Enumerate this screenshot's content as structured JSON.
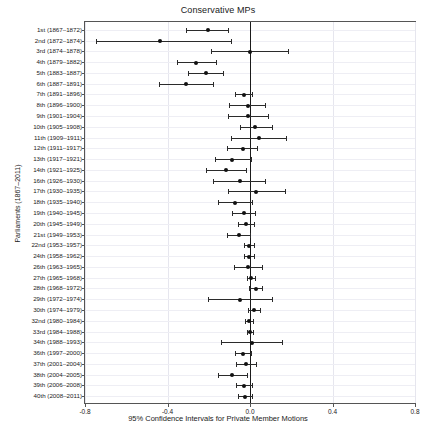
{
  "chart_data": {
    "type": "scatter",
    "subtype": "forest-plot",
    "title": "Conservative MPs",
    "xlabel": "95% Confidence Intervals for Private Member Motions",
    "ylabel": "Parliaments (1867–2011)",
    "xlim": [
      -0.8,
      0.8
    ],
    "xticks": [
      -0.8,
      -0.4,
      0.0,
      0.4,
      0.8
    ],
    "xticklabels": [
      "-0.8",
      "-0.4",
      "0.0",
      "0.4",
      "0.8"
    ],
    "grid": true,
    "legend": null,
    "reference_line": 0.0,
    "categories": [
      "1st (1867–1872)",
      "2nd (1872–1874)",
      "3rd (1874–1878)",
      "4th (1879–1882)",
      "5th (1883–1887)",
      "6th (1887–1891)",
      "7th (1891–1896)",
      "8th (1896–1900)",
      "9th (1901–1904)",
      "10th (1905–1908)",
      "11th (1909–1911)",
      "12th (1911–1917)",
      "13th (1917–1921)",
      "14th (1921–1925)",
      "16th (1926–1930)",
      "17th (1930–1935)",
      "18th (1935–1940)",
      "19th (1940–1945)",
      "20th (1945–1949)",
      "21st (1949–1953)",
      "22nd (1953–1957)",
      "24th (1958–1962)",
      "26th (1963–1965)",
      "27th (1965–1968)",
      "28th (1968–1972)",
      "29th (1972–1974)",
      "30th (1974–1979)",
      "32nd (1980–1984)",
      "33rd (1984–1988)",
      "34th (1988–1993)",
      "36th (1997–2000)",
      "37th (2001–2004)",
      "38th (2004–2005)",
      "39th (2006–2008)",
      "40th (2008–2011)"
    ],
    "estimates": [
      -0.205,
      -0.435,
      0.0,
      -0.26,
      -0.215,
      -0.31,
      -0.03,
      -0.01,
      -0.01,
      0.025,
      0.045,
      -0.035,
      -0.085,
      -0.115,
      -0.05,
      0.03,
      -0.075,
      -0.03,
      -0.02,
      -0.055,
      -0.005,
      -0.005,
      -0.01,
      0.005,
      0.03,
      -0.05,
      0.02,
      -0.005,
      0.0,
      0.01,
      -0.035,
      -0.02,
      -0.085,
      -0.03,
      -0.025
    ],
    "ci_low": [
      -0.31,
      -0.745,
      -0.19,
      -0.355,
      -0.3,
      -0.44,
      -0.075,
      -0.1,
      -0.105,
      -0.05,
      -0.09,
      -0.11,
      -0.17,
      -0.215,
      -0.18,
      -0.105,
      -0.155,
      -0.085,
      -0.06,
      -0.11,
      -0.03,
      -0.03,
      -0.08,
      -0.015,
      -0.005,
      -0.205,
      -0.01,
      -0.025,
      -0.015,
      -0.14,
      -0.075,
      -0.07,
      -0.155,
      -0.07,
      -0.06
    ],
    "ci_high": [
      -0.105,
      -0.09,
      0.185,
      -0.165,
      -0.13,
      -0.18,
      0.01,
      0.075,
      0.085,
      0.105,
      0.175,
      0.035,
      0.005,
      -0.02,
      0.075,
      0.17,
      0.01,
      0.025,
      0.02,
      0.0,
      0.02,
      0.02,
      0.06,
      0.025,
      0.06,
      0.105,
      0.05,
      0.015,
      0.015,
      0.155,
      0.005,
      0.03,
      -0.015,
      0.01,
      0.01
    ]
  }
}
